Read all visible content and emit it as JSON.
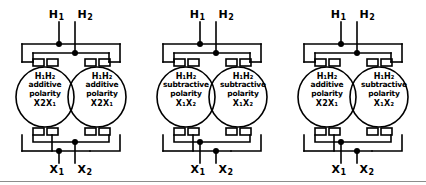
{
  "figure": {
    "line_color": "#000000",
    "background_color": "#ffffff",
    "rule_color": "#8c8c8c"
  },
  "groups": [
    {
      "id": "group-1",
      "top_terminals": {
        "left": "H",
        "left_sub": "1",
        "right": "H",
        "right_sub": "2"
      },
      "bottom_terminals": {
        "left": "X",
        "left_sub": "1",
        "right": "X",
        "right_sub": "2"
      },
      "transformers": [
        {
          "position": "left",
          "line1": "H₁H₂",
          "line2": "additive",
          "line3": "polarity",
          "line4": "X2X₁",
          "polarity": "additive"
        },
        {
          "position": "right",
          "line1": "H₁H₂",
          "line2": "additive",
          "line3": "polarity",
          "line4": "X2X₁",
          "polarity": "additive"
        }
      ]
    },
    {
      "id": "group-2",
      "top_terminals": {
        "left": "H",
        "left_sub": "1",
        "right": "H",
        "right_sub": "2"
      },
      "bottom_terminals": {
        "left": "X",
        "left_sub": "1",
        "right": "X",
        "right_sub": "2"
      },
      "transformers": [
        {
          "position": "left",
          "line1": "H₁H₂",
          "line2": "subtractive",
          "line3": "polarity",
          "line4": "X₁X₂",
          "polarity": "subtractive"
        },
        {
          "position": "right",
          "line1": "H₁H₂",
          "line2": "subtractive",
          "line3": "polarity",
          "line4": "X₁X₂",
          "polarity": "subtractive"
        }
      ]
    },
    {
      "id": "group-3",
      "top_terminals": {
        "left": "H",
        "left_sub": "1",
        "right": "H",
        "right_sub": "2"
      },
      "bottom_terminals": {
        "left": "X",
        "left_sub": "1",
        "right": "X",
        "right_sub": "2"
      },
      "transformers": [
        {
          "position": "left",
          "line1": "H₁H₂",
          "line2": "additive",
          "line3": "polarity",
          "line4": "X2X₁",
          "polarity": "additive"
        },
        {
          "position": "right",
          "line1": "H₁H₂",
          "line2": "subtractive",
          "line3": "polarity",
          "line4": "X₁X₂",
          "polarity": "subtractive"
        }
      ]
    }
  ]
}
